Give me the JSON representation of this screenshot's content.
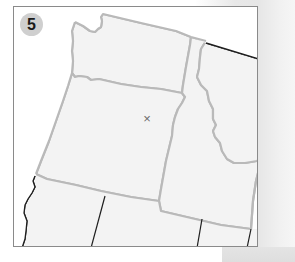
{
  "figure": {
    "panel_number": "5",
    "marker_symbol": "×"
  },
  "map": {
    "region": "Pacific Northwest",
    "state_fill": "#f3f3f3",
    "state_border_color": "#b9b9b9",
    "outer_boundary_color": "#1e1e1e",
    "frame_border_color": "#8a8a8a",
    "badge_color": "#cfcfcf",
    "marker_color": "#6b6b6b"
  }
}
